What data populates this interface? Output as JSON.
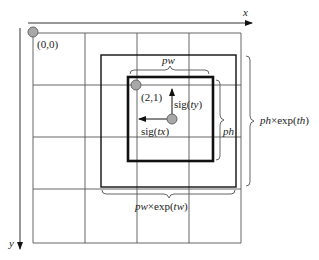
{
  "axes": {
    "x_label": "x",
    "y_label": "y"
  },
  "grid": {
    "rows": 4,
    "cols": 4
  },
  "points": {
    "origin": "(0,0)",
    "cell": "(2,1)"
  },
  "labels": {
    "sig_ty": "sig(ty)",
    "sig_ty_prefix": "sig(",
    "sig_ty_var": "ty",
    "sig_tx_prefix": "sig(",
    "sig_tx_var": "tx",
    "close_paren": ")",
    "pw": "pw",
    "ph": "ph",
    "pw_exp_var": "pw",
    "pw_exp_mid": "×exp(",
    "pw_exp_t": "tw",
    "ph_exp_var": "ph",
    "ph_exp_mid": "×exp(",
    "ph_exp_t": "th"
  },
  "colors": {
    "grid": "#555555",
    "box": "#111111",
    "dot_fill": "#a8a8a8",
    "dot_stroke": "#666666",
    "brace": "#555555"
  }
}
